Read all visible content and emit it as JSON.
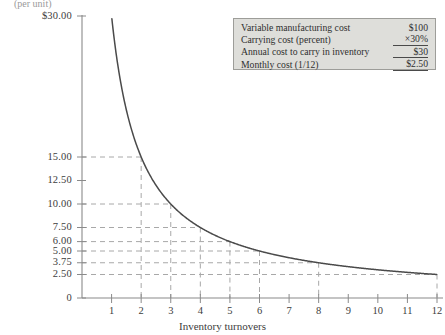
{
  "chart_data": {
    "type": "line",
    "title": "",
    "xlabel": "Inventory turnovers",
    "ylabel": "(per unit)",
    "y_axis_top_label": "$30.00",
    "xlim": [
      0,
      12
    ],
    "ylim": [
      0,
      30
    ],
    "grid": "dashed-guides",
    "function": "y = 30 / x",
    "x": [
      1,
      2,
      3,
      4,
      5,
      6,
      7,
      8,
      9,
      10,
      11,
      12
    ],
    "values": [
      30.0,
      15.0,
      10.0,
      7.5,
      6.0,
      5.0,
      4.29,
      3.75,
      3.33,
      3.0,
      2.73,
      2.5
    ],
    "xticks": [
      "1",
      "2",
      "3",
      "4",
      "5",
      "6",
      "7",
      "8",
      "9",
      "10",
      "11",
      "12"
    ],
    "yticks": [
      "0",
      "2.50",
      "3.75",
      "5.00",
      "6.00",
      "7.50",
      "10.00",
      "12.50",
      "15.00",
      "$30.00"
    ],
    "ytick_values": [
      0,
      2.5,
      3.75,
      5.0,
      6.0,
      7.5,
      10.0,
      12.5,
      15.0,
      30.0
    ],
    "guide_points": [
      {
        "x": 2,
        "y": 15.0
      },
      {
        "x": 3,
        "y": 10.0
      },
      {
        "x": 4,
        "y": 7.5
      },
      {
        "x": 5,
        "y": 6.0
      },
      {
        "x": 6,
        "y": 5.0
      },
      {
        "x": 8,
        "y": 3.75
      },
      {
        "x": 12,
        "y": 2.5
      }
    ],
    "legend_position": "top-right"
  },
  "legend": {
    "rows": [
      {
        "label": "Variable manufacturing cost",
        "value": "$100",
        "rule": "none"
      },
      {
        "label": "Carrying cost (percent)",
        "value": "×30%",
        "rule": "single"
      },
      {
        "label": "Annual cost to carry in inventory",
        "value": "$30",
        "rule": "single"
      },
      {
        "label": "Monthly cost (1/12)",
        "value": "$2.50",
        "rule": "double"
      }
    ]
  }
}
